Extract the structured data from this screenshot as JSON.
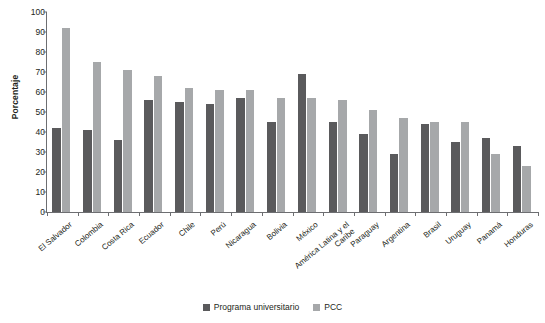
{
  "chart_data": {
    "type": "bar",
    "title": "",
    "xlabel": "",
    "ylabel": "Porcentaje",
    "ylim": [
      0,
      100
    ],
    "yticks": [
      0,
      10,
      20,
      30,
      40,
      50,
      60,
      70,
      80,
      90,
      100
    ],
    "grid": false,
    "legend_position": "bottom-center",
    "categories": [
      "El Salvador",
      "Colombia",
      "Costa Rica",
      "Ecuador",
      "Chile",
      "Perú",
      "Nicaragua",
      "Bolivia",
      "México",
      "América Latina y el Caribe",
      "Paraguay",
      "Argentina",
      "Brasil",
      "Uruguay",
      "Panamá",
      "Honduras"
    ],
    "series": [
      {
        "name": "Programa universitario",
        "color": "#5a5a5c",
        "values": [
          42,
          41,
          36,
          56,
          55,
          54,
          57,
          45,
          69,
          45,
          39,
          29,
          44,
          35,
          37,
          33
        ]
      },
      {
        "name": "PCC",
        "color": "#a6a8aa",
        "values": [
          92,
          75,
          71,
          68,
          62,
          61,
          61,
          57,
          57,
          56,
          51,
          47,
          45,
          45,
          29,
          23
        ]
      }
    ]
  },
  "axis": {
    "y_title": "Porcentaje"
  },
  "legend": {
    "items": [
      {
        "label": "Programa universitario",
        "color": "#5a5a5c"
      },
      {
        "label": "PCC",
        "color": "#a6a8aa"
      }
    ]
  }
}
